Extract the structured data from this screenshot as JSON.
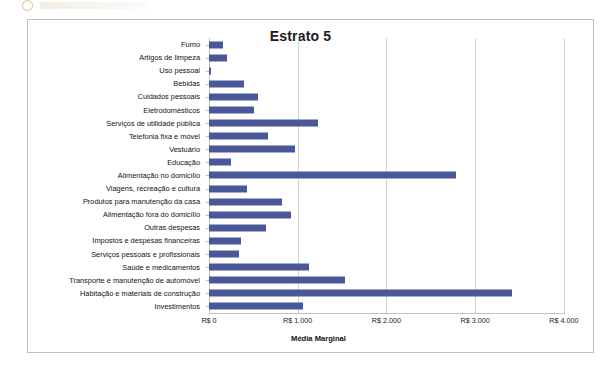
{
  "chart_data": {
    "type": "bar",
    "orientation": "horizontal",
    "title": "Estrato 5",
    "xlabel": "Média Marginal",
    "ylabel": "",
    "xlim": [
      0,
      4000
    ],
    "xticks": [
      0,
      1000,
      2000,
      3000,
      4000
    ],
    "xtick_labels": [
      "R$ 0",
      "R$ 1.000",
      "R$ 2.000",
      "R$ 3.000",
      "R$ 4.000"
    ],
    "grid": true,
    "legend": false,
    "bar_color": "#4a5899",
    "categories": [
      "Fumo",
      "Artigos de limpeza",
      "Uso pessoal",
      "Bebidas",
      "Cuidados pessoais",
      "Eletrodomésticos",
      "Serviços de utilidade pública",
      "Telefonia fixa e móvel",
      "Vestuário",
      "Educação",
      "Alimentação no domicílio",
      "Viagens, recreação e cultura",
      "Produtos para manutenção da casa",
      "Alimentação fora do domicílio",
      "Outras despesas",
      "Impostos e despesas financeiras",
      "Serviços pessoais e profissionais",
      "Saúde e medicamentos",
      "Transporte e manutenção de automóvel",
      "Habitação e materiais de construção",
      "Investimentos"
    ],
    "values": [
      160,
      200,
      25,
      390,
      550,
      510,
      1230,
      670,
      970,
      250,
      2780,
      430,
      820,
      920,
      640,
      360,
      340,
      1130,
      1530,
      3420,
      1060
    ]
  }
}
